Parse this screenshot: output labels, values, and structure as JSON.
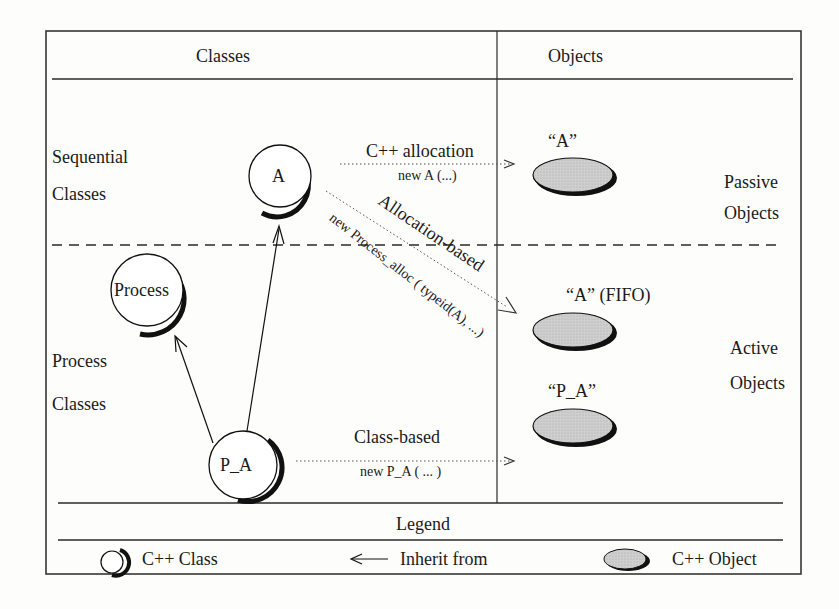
{
  "header": {
    "classes_title": "Classes",
    "objects_title": "Objects"
  },
  "rows": {
    "sequential_line1": "Sequential",
    "sequential_line2": "Classes",
    "process_line1": "Process",
    "process_line2": "Classes",
    "passive_line1": "Passive",
    "passive_line2": "Objects",
    "active_line1": "Active",
    "active_line2": "Objects"
  },
  "classes": {
    "a": "A",
    "process": "Process",
    "p_a": "P_A"
  },
  "objects": {
    "passive_a": "“A”",
    "active_a": "“A” (FIFO)",
    "active_pa": "“P_A”"
  },
  "relations": {
    "cpp_alloc_title": "C++ allocation",
    "cpp_alloc_code": "new  A (...)",
    "alloc_based_title": "Allocation-based",
    "alloc_based_code": "new Process_alloc ( typeid(A), ...)",
    "class_based_title": "Class-based",
    "class_based_code": "new  P_A ( ... )"
  },
  "legend": {
    "title": "Legend",
    "class_label": "C++ Class",
    "inherit_label": "Inherit from",
    "object_label": "C++ Object"
  },
  "colors": {
    "line": "#2a2a2a",
    "object_fill": "#c8c8c8",
    "background": "#fdfdfb"
  }
}
